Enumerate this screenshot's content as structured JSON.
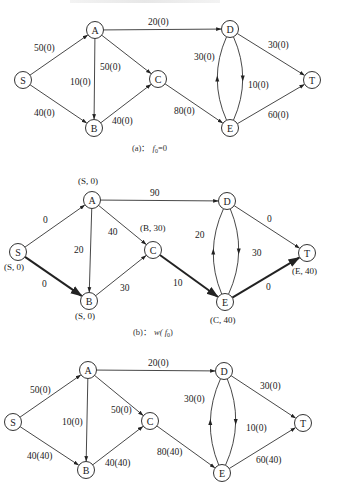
{
  "figures": [
    {
      "id": "a",
      "caption_prefix": "(a)：",
      "caption_math": "f",
      "caption_sub": "0",
      "caption_suffix": "=0",
      "nodes": [
        {
          "id": "S",
          "label": "S",
          "x": 23,
          "y": 80
        },
        {
          "id": "A",
          "label": "A",
          "x": 95,
          "y": 30
        },
        {
          "id": "B",
          "label": "B",
          "x": 94,
          "y": 128
        },
        {
          "id": "C",
          "label": "C",
          "x": 158,
          "y": 79
        },
        {
          "id": "D",
          "label": "D",
          "x": 230,
          "y": 29
        },
        {
          "id": "E",
          "label": "E",
          "x": 230,
          "y": 128
        },
        {
          "id": "T",
          "label": "T",
          "x": 312,
          "y": 80
        }
      ],
      "edges": [
        {
          "from": "S",
          "to": "A",
          "label": "50(0)",
          "lx": 34,
          "ly": 51
        },
        {
          "from": "S",
          "to": "B",
          "label": "40(0)",
          "lx": 34,
          "ly": 116
        },
        {
          "from": "A",
          "to": "B",
          "label": "10(0)",
          "lx": 70,
          "ly": 85
        },
        {
          "from": "A",
          "to": "C",
          "label": "50(0)",
          "lx": 100,
          "ly": 70
        },
        {
          "from": "A",
          "to": "D",
          "label": "20(0)",
          "lx": 148,
          "ly": 25
        },
        {
          "from": "B",
          "to": "C",
          "label": "40(0)",
          "lx": 112,
          "ly": 124
        },
        {
          "from": "C",
          "to": "E",
          "label": "80(0)",
          "lx": 174,
          "ly": 114
        },
        {
          "from": "D",
          "to": "T",
          "label": "30(0)",
          "lx": 268,
          "ly": 48
        },
        {
          "from": "D",
          "to": "E",
          "label": "10(0)",
          "lx": 248,
          "ly": 88,
          "curve": "right"
        },
        {
          "from": "E",
          "to": "D",
          "label": "30(0)",
          "lx": 194,
          "ly": 60,
          "curve": "left"
        },
        {
          "from": "E",
          "to": "T",
          "label": "60(0)",
          "lx": 268,
          "ly": 118
        }
      ],
      "caption_x": 132,
      "caption_y": 151
    },
    {
      "id": "b",
      "caption_prefix": "(b)：",
      "caption_math": "w( f",
      "caption_sub": "0",
      "caption_suffix": ")",
      "nodes": [
        {
          "id": "S",
          "label": "S",
          "x": 18,
          "y": 252,
          "tag": "(S, 0)",
          "tx": 4,
          "ty": 270
        },
        {
          "id": "A",
          "label": "A",
          "x": 92,
          "y": 200,
          "tag": "(S, 0)",
          "tx": 78,
          "ty": 184
        },
        {
          "id": "B",
          "label": "B",
          "x": 89,
          "y": 301,
          "tag": "(S, 0)",
          "tx": 75,
          "ty": 319
        },
        {
          "id": "C",
          "label": "C",
          "x": 153,
          "y": 250,
          "tag": "(B, 30)",
          "tx": 140,
          "ty": 231
        },
        {
          "id": "D",
          "label": "D",
          "x": 227,
          "y": 201
        },
        {
          "id": "E",
          "label": "E",
          "x": 225,
          "y": 302,
          "tag": "(C, 40)",
          "tx": 210,
          "ty": 323
        },
        {
          "id": "T",
          "label": "T",
          "x": 307,
          "y": 253,
          "tag": "(E, 40)",
          "tx": 292,
          "ty": 274
        }
      ],
      "edges": [
        {
          "from": "S",
          "to": "A",
          "label": "0",
          "lx": 43,
          "ly": 223
        },
        {
          "from": "S",
          "to": "B",
          "label": "0",
          "lx": 42,
          "ly": 287,
          "thick": true
        },
        {
          "from": "A",
          "to": "B",
          "label": "20",
          "lx": 74,
          "ly": 253
        },
        {
          "from": "A",
          "to": "C",
          "label": "40",
          "lx": 108,
          "ly": 235
        },
        {
          "from": "A",
          "to": "D",
          "label": "90",
          "lx": 150,
          "ly": 196
        },
        {
          "from": "B",
          "to": "C",
          "label": "30",
          "lx": 120,
          "ly": 291
        },
        {
          "from": "C",
          "to": "E",
          "label": "10",
          "lx": 173,
          "ly": 286,
          "thick": true
        },
        {
          "from": "D",
          "to": "T",
          "label": "0",
          "lx": 267,
          "ly": 222
        },
        {
          "from": "D",
          "to": "E",
          "label": "30",
          "lx": 252,
          "ly": 256,
          "curve": "right"
        },
        {
          "from": "E",
          "to": "D",
          "label": "20",
          "lx": 195,
          "ly": 238,
          "curve": "left"
        },
        {
          "from": "E",
          "to": "T",
          "label": "0",
          "lx": 266,
          "ly": 290,
          "thick": true
        }
      ],
      "caption_x": 133,
      "caption_y": 335
    },
    {
      "id": "c",
      "nodes": [
        {
          "id": "S",
          "label": "S",
          "x": 13,
          "y": 422
        },
        {
          "id": "A",
          "label": "A",
          "x": 88,
          "y": 370
        },
        {
          "id": "B",
          "label": "B",
          "x": 86,
          "y": 470
        },
        {
          "id": "C",
          "label": "C",
          "x": 150,
          "y": 421
        },
        {
          "id": "D",
          "label": "D",
          "x": 224,
          "y": 371
        },
        {
          "id": "E",
          "label": "E",
          "x": 222,
          "y": 473
        },
        {
          "id": "T",
          "label": "T",
          "x": 303,
          "y": 423
        }
      ],
      "edges": [
        {
          "from": "S",
          "to": "A",
          "label": "50(0)",
          "lx": 30,
          "ly": 393
        },
        {
          "from": "S",
          "to": "B",
          "label": "40(40)",
          "lx": 27,
          "ly": 459
        },
        {
          "from": "A",
          "to": "B",
          "label": "10(0)",
          "lx": 62,
          "ly": 425
        },
        {
          "from": "A",
          "to": "C",
          "label": "50(0)",
          "lx": 111,
          "ly": 413
        },
        {
          "from": "A",
          "to": "D",
          "label": "20(0)",
          "lx": 148,
          "ly": 366
        },
        {
          "from": "B",
          "to": "C",
          "label": "40(40)",
          "lx": 105,
          "ly": 466
        },
        {
          "from": "C",
          "to": "E",
          "label": "80(40)",
          "lx": 157,
          "ly": 455
        },
        {
          "from": "D",
          "to": "T",
          "label": "30(0)",
          "lx": 260,
          "ly": 389
        },
        {
          "from": "D",
          "to": "E",
          "label": "10(0)",
          "lx": 246,
          "ly": 431,
          "curve": "right"
        },
        {
          "from": "E",
          "to": "D",
          "label": "30(0)",
          "lx": 184,
          "ly": 402,
          "curve": "left"
        },
        {
          "from": "E",
          "to": "T",
          "label": "60(40)",
          "lx": 256,
          "ly": 463
        }
      ]
    }
  ]
}
